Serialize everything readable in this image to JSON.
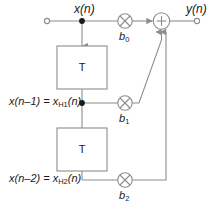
{
  "diagram": {
    "colors": {
      "line": "#8c8c8c",
      "text": "#1a1a1a",
      "background": "#ffffff",
      "node_fill": "#1a1a1a"
    },
    "signals": {
      "input_label": "x(n)",
      "output_label": "y(n)",
      "tap1_label_main": "x(n–1) = x",
      "tap1_label_sub": "H1",
      "tap1_label_tail": "(n)",
      "tap2_label_main": "x(n–2) = x",
      "tap2_label_sub": "H2",
      "tap2_label_tail": "(n)"
    },
    "blocks": [
      {
        "name": "delay-block-1",
        "label": "T"
      },
      {
        "name": "delay-block-2",
        "label": "T"
      }
    ],
    "multipliers": [
      {
        "name": "multiplier-b0",
        "symbol": "⊗",
        "coefficient_main": "b",
        "coefficient_sub": "0"
      },
      {
        "name": "multiplier-b1",
        "symbol": "⊗",
        "coefficient_main": "b",
        "coefficient_sub": "1"
      },
      {
        "name": "multiplier-b2",
        "symbol": "⊗",
        "coefficient_main": "b",
        "coefficient_sub": "2"
      }
    ],
    "adder": {
      "name": "adder-node",
      "symbol": "+"
    },
    "terminals": [
      {
        "name": "input-terminal",
        "type": "open-circle"
      },
      {
        "name": "output-terminal",
        "type": "open-circle"
      }
    ],
    "junctions": [
      {
        "name": "junction-input-tap",
        "type": "filled-dot"
      },
      {
        "name": "junction-tap1",
        "type": "filled-dot"
      }
    ]
  }
}
